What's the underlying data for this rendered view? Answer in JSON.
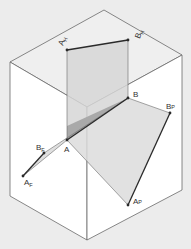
{
  "diagram": {
    "colors": {
      "background": "#ececec",
      "box_face": "#ffffff",
      "box_edge": "#6a6a6a",
      "projection_plane": "#d8d8d8",
      "triangle": "#a9a9a9",
      "segment": "#2a2a2a"
    },
    "labels": {
      "A": "A",
      "B": "B",
      "AH": "A",
      "AH_sub": "H",
      "BH": "B",
      "BH_sub": "H",
      "AF": "A",
      "AF_sub": "F",
      "BF": "B",
      "BF_sub": "F",
      "AP": "A",
      "AP_sub": "P",
      "BP": "B",
      "BP_sub": "P"
    }
  }
}
